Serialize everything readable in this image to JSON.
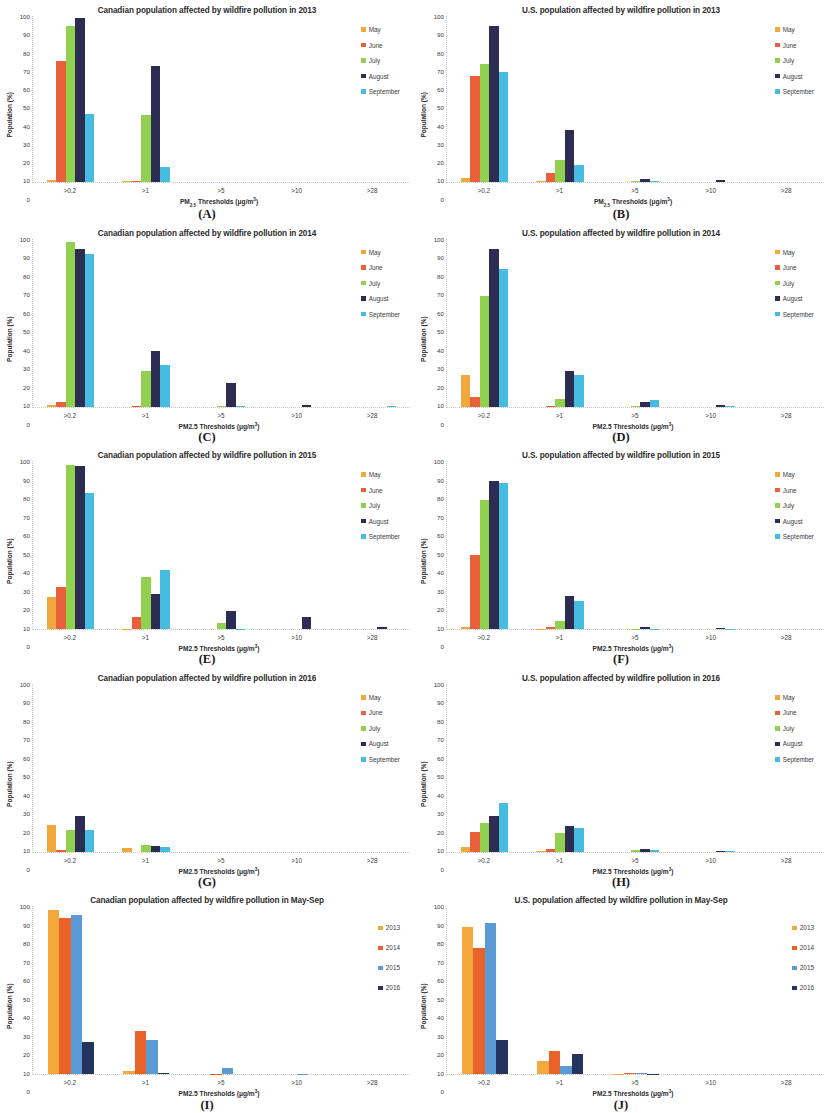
{
  "figure": {
    "axis": {
      "ylabel": "Population (%)",
      "yticks": [
        "100",
        "90",
        "80",
        "70",
        "60",
        "50",
        "40",
        "30",
        "20",
        "10",
        "0"
      ],
      "ylim": [
        0,
        100
      ],
      "xticks": [
        ">0.2",
        ">1",
        ">5",
        ">10",
        ">28"
      ],
      "xlabel_sub": "PM2.5 Thresholds (μg/m³)",
      "xlabel_plain": "PM2.5 Thresholds (μg/m³)"
    },
    "colors": {
      "may": "#F2A93B",
      "june": "#E8603C",
      "july": "#92D050",
      "august": "#2D2D54",
      "september": "#45BCE0",
      "y2013": "#F5A93C",
      "y2014": "#E8622A",
      "y2015": "#5B9BD5",
      "y2016": "#25345C"
    },
    "panels": [
      {
        "letter": "(A)",
        "title": "Canadian population affected by wildfire pollution in 2013",
        "xlabel_style": "sub",
        "legend": [
          "May",
          "June",
          "July",
          "August",
          "September"
        ],
        "legend_colors": [
          "#F2A93B",
          "#E8603C",
          "#92D050",
          "#2D2D54",
          "#45BCE0"
        ],
        "chart_data": {
          "type": "bar",
          "title": "Canadian population affected by wildfire pollution in 2013",
          "xlabel": "PM2.5 Thresholds (μg/m³)",
          "ylabel": "Population (%)",
          "ylim": [
            0,
            100
          ],
          "categories": [
            ">0.2",
            ">1",
            ">5",
            ">10",
            ">28"
          ],
          "series": [
            {
              "name": "May",
              "values": [
                1.0,
                0.5,
                0,
                0,
                0
              ]
            },
            {
              "name": "June",
              "values": [
                73,
                0.3,
                0,
                0,
                0
              ]
            },
            {
              "name": "July",
              "values": [
                94,
                40,
                0,
                0,
                0
              ]
            },
            {
              "name": "August",
              "values": [
                99,
                70,
                0,
                0,
                0
              ]
            },
            {
              "name": "September",
              "values": [
                41,
                9,
                0,
                0,
                0
              ]
            }
          ]
        }
      },
      {
        "letter": "(B)",
        "title": "U.S. population affected by wildfire pollution in 2013",
        "xlabel_style": "sub",
        "legend": [
          "May",
          "June",
          "July",
          "August",
          "September"
        ],
        "legend_colors": [
          "#F2A93B",
          "#E8603C",
          "#92D050",
          "#2D2D54",
          "#45BCE0"
        ],
        "chart_data": {
          "type": "bar",
          "title": "U.S. population affected by wildfire pollution in 2013",
          "xlabel": "PM2.5 Thresholds (μg/m³)",
          "ylabel": "Population (%)",
          "ylim": [
            0,
            100
          ],
          "categories": [
            ">0.2",
            ">1",
            ">5",
            ">10",
            ">28"
          ],
          "series": [
            {
              "name": "May",
              "values": [
                2,
                0.2,
                0,
                0,
                0
              ]
            },
            {
              "name": "June",
              "values": [
                64,
                5,
                0,
                0,
                0
              ]
            },
            {
              "name": "July",
              "values": [
                71,
                13,
                0.3,
                0,
                0
              ]
            },
            {
              "name": "August",
              "values": [
                94,
                31,
                1.5,
                0.7,
                0
              ]
            },
            {
              "name": "September",
              "values": [
                66,
                10,
                0.3,
                0,
                0
              ]
            }
          ]
        }
      },
      {
        "letter": "(C)",
        "title": "Canadian population affected by wildfire pollution in 2014",
        "xlabel_style": "plain",
        "legend": [
          "May",
          "June",
          "July",
          "August",
          "September"
        ],
        "legend_colors": [
          "#F2A93B",
          "#E8603C",
          "#92D050",
          "#2D2D54",
          "#45BCE0"
        ],
        "chart_data": {
          "type": "bar",
          "title": "Canadian population affected by wildfire pollution in 2014",
          "xlabel": "PM2.5 Thresholds (μg/m³)",
          "ylabel": "Population (%)",
          "ylim": [
            0,
            100
          ],
          "categories": [
            ">0.2",
            ">1",
            ">5",
            ">10",
            ">28"
          ],
          "series": [
            {
              "name": "May",
              "values": [
                1.2,
                0,
                0,
                0,
                0
              ]
            },
            {
              "name": "June",
              "values": [
                2.5,
                0.3,
                0,
                0,
                0
              ]
            },
            {
              "name": "July",
              "values": [
                98,
                21,
                0.5,
                0,
                0
              ]
            },
            {
              "name": "August",
              "values": [
                94,
                33,
                14,
                1.2,
                0
              ]
            },
            {
              "name": "September",
              "values": [
                91,
                25,
                0.2,
                0,
                0.3
              ]
            }
          ]
        }
      },
      {
        "letter": "(D)",
        "title": "U.S. population affected by wildfire pollution in 2014",
        "xlabel_style": "plain",
        "legend": [
          "May",
          "June",
          "July",
          "August",
          "September"
        ],
        "legend_colors": [
          "#F2A93B",
          "#E8603C",
          "#92D050",
          "#2D2D54",
          "#45BCE0"
        ],
        "chart_data": {
          "type": "bar",
          "title": "U.S. population affected by wildfire pollution in 2014",
          "xlabel": "PM2.5 Thresholds (μg/m³)",
          "ylabel": "Population (%)",
          "ylim": [
            0,
            100
          ],
          "categories": [
            ">0.2",
            ">1",
            ">5",
            ">10",
            ">28"
          ],
          "series": [
            {
              "name": "May",
              "values": [
                19,
                0,
                0,
                0,
                0
              ]
            },
            {
              "name": "June",
              "values": [
                5.5,
                0.2,
                0,
                0,
                0
              ]
            },
            {
              "name": "July",
              "values": [
                66,
                4.5,
                0.3,
                0,
                0
              ]
            },
            {
              "name": "August",
              "values": [
                94,
                21,
                2.5,
                0.8,
                0
              ]
            },
            {
              "name": "September",
              "values": [
                82,
                19,
                4,
                0.5,
                0
              ]
            }
          ]
        }
      },
      {
        "letter": "(E)",
        "title": "Canadian population affected by wildfire pollution in 2015",
        "xlabel_style": "plain",
        "legend": [
          "May",
          "June",
          "July",
          "August",
          "September"
        ],
        "legend_colors": [
          "#F2A93B",
          "#E8603C",
          "#92D050",
          "#2D2D54",
          "#45BCE0"
        ],
        "chart_data": {
          "type": "bar",
          "title": "Canadian population affected by wildfire pollution in 2015",
          "xlabel": "PM2.5 Thresholds (μg/m³)",
          "ylabel": "Population (%)",
          "ylim": [
            0,
            100
          ],
          "categories": [
            ">0.2",
            ">1",
            ">5",
            ">10",
            ">28"
          ],
          "series": [
            {
              "name": "May",
              "values": [
                19,
                0.3,
                0,
                0,
                0
              ]
            },
            {
              "name": "June",
              "values": [
                25,
                7,
                0,
                0,
                0
              ]
            },
            {
              "name": "July",
              "values": [
                98,
                31,
                3.5,
                0,
                0
              ]
            },
            {
              "name": "August",
              "values": [
                97,
                21,
                10.5,
                7,
                1.2
              ]
            },
            {
              "name": "September",
              "values": [
                81,
                35,
                0.3,
                0,
                0
              ]
            }
          ]
        }
      },
      {
        "letter": "(F)",
        "title": "U.S. population affected by wildfire pollution in 2015",
        "xlabel_style": "plain",
        "legend": [
          "May",
          "June",
          "July",
          "August",
          "September"
        ],
        "legend_colors": [
          "#F2A93B",
          "#E8603C",
          "#92D050",
          "#2D2D54",
          "#45BCE0"
        ],
        "chart_data": {
          "type": "bar",
          "title": "U.S. population affected by wildfire pollution in 2015",
          "xlabel": "PM2.5 Thresholds (μg/m³)",
          "ylabel": "Population (%)",
          "ylim": [
            0,
            100
          ],
          "categories": [
            ">0.2",
            ">1",
            ">5",
            ">10",
            ">28"
          ],
          "series": [
            {
              "name": "May",
              "values": [
                1.5,
                0.2,
                0,
                0,
                0
              ]
            },
            {
              "name": "June",
              "values": [
                44,
                1.5,
                0,
                0,
                0
              ]
            },
            {
              "name": "July",
              "values": [
                77,
                5,
                0.3,
                0,
                0
              ]
            },
            {
              "name": "August",
              "values": [
                88,
                20,
                1.5,
                0.6,
                0
              ]
            },
            {
              "name": "September",
              "values": [
                87,
                16.5,
                0.3,
                0.3,
                0
              ]
            }
          ]
        }
      },
      {
        "letter": "(G)",
        "title": "Canadian population affected by wildfire pollution in 2016",
        "xlabel_style": "plain",
        "legend": [
          "May",
          "June",
          "July",
          "August",
          "September"
        ],
        "legend_colors": [
          "#F2A93B",
          "#E8603C",
          "#92D050",
          "#2D2D54",
          "#45BCE0"
        ],
        "chart_data": {
          "type": "bar",
          "title": "Canadian population affected by wildfire pollution in 2016",
          "xlabel": "PM2.5 Thresholds (μg/m³)",
          "ylabel": "Population (%)",
          "ylim": [
            0,
            100
          ],
          "categories": [
            ">0.2",
            ">1",
            ">5",
            ">10",
            ">28"
          ],
          "series": [
            {
              "name": "May",
              "values": [
                16,
                2.5,
                0,
                0,
                0
              ]
            },
            {
              "name": "June",
              "values": [
                1.0,
                0,
                0,
                0,
                0
              ]
            },
            {
              "name": "July",
              "values": [
                13,
                4,
                0,
                0,
                0
              ]
            },
            {
              "name": "August",
              "values": [
                21,
                3.5,
                0,
                0,
                0
              ]
            },
            {
              "name": "September",
              "values": [
                13,
                3,
                0,
                0,
                0
              ]
            }
          ]
        }
      },
      {
        "letter": "(H)",
        "title": "U.S. population affected by wildfire pollution in 2016",
        "xlabel_style": "plain",
        "legend": [
          "May",
          "June",
          "July",
          "August",
          "September"
        ],
        "legend_colors": [
          "#F2A93B",
          "#E8603C",
          "#92D050",
          "#2D2D54",
          "#45BCE0"
        ],
        "chart_data": {
          "type": "bar",
          "title": "U.S. population affected by wildfire pollution in 2016",
          "xlabel": "PM2.5 Thresholds (μg/m³)",
          "ylabel": "Population (%)",
          "ylim": [
            0,
            100
          ],
          "categories": [
            ">0.2",
            ">1",
            ">5",
            ">10",
            ">28"
          ],
          "series": [
            {
              "name": "May",
              "values": [
                3,
                0.2,
                0,
                0,
                0
              ]
            },
            {
              "name": "June",
              "values": [
                12,
                1.5,
                0,
                0,
                0
              ]
            },
            {
              "name": "July",
              "values": [
                17,
                11,
                0.8,
                0,
                0
              ]
            },
            {
              "name": "August",
              "values": [
                21,
                15.5,
                1.8,
                0.3,
                0
              ]
            },
            {
              "name": "September",
              "values": [
                29,
                14,
                0.8,
                0.3,
                0
              ]
            }
          ]
        }
      },
      {
        "letter": "(I)",
        "title": "Canadian population affected by wildfire pollution in May-Sep",
        "xlabel_style": "plain",
        "legend": [
          "2013",
          "2014",
          "2015",
          "2016"
        ],
        "legend_colors": [
          "#F5A93C",
          "#E8622A",
          "#5B9BD5",
          "#25345C"
        ],
        "chart_data": {
          "type": "bar",
          "title": "Canadian population affected by wildfire pollution in May-Sep",
          "xlabel": "PM2.5 Thresholds (μg/m³)",
          "ylabel": "Population (%)",
          "ylim": [
            0,
            100
          ],
          "categories": [
            ">0.2",
            ">1",
            ">5",
            ">10",
            ">28"
          ],
          "series": [
            {
              "name": "2013",
              "values": [
                98,
                2,
                0,
                0,
                0
              ]
            },
            {
              "name": "2014",
              "values": [
                93,
                26,
                0.3,
                0,
                0
              ]
            },
            {
              "name": "2015",
              "values": [
                95,
                20.5,
                3.5,
                0.4,
                0
              ]
            },
            {
              "name": "2016",
              "values": [
                19,
                0.5,
                0,
                0,
                0
              ]
            }
          ]
        }
      },
      {
        "letter": "(J)",
        "title": "U.S. population affected by wildfire pollution in May-Sep",
        "xlabel_style": "plain",
        "legend": [
          "2013",
          "2014",
          "2015",
          "2016"
        ],
        "legend_colors": [
          "#F5A93C",
          "#E8622A",
          "#5B9BD5",
          "#25345C"
        ],
        "chart_data": {
          "type": "bar",
          "title": "U.S. population affected by wildfire pollution in May-Sep",
          "xlabel": "PM2.5 Thresholds (μg/m³)",
          "ylabel": "Population (%)",
          "ylim": [
            0,
            100
          ],
          "categories": [
            ">0.2",
            ">1",
            ">5",
            ">10",
            ">28"
          ],
          "series": [
            {
              "name": "2013",
              "values": [
                88,
                8,
                0.2,
                0,
                0
              ]
            },
            {
              "name": "2014",
              "values": [
                75.5,
                14,
                0.5,
                0,
                0
              ]
            },
            {
              "name": "2015",
              "values": [
                90,
                5,
                0.5,
                0,
                0
              ]
            },
            {
              "name": "2016",
              "values": [
                20.5,
                12,
                0.3,
                0,
                0
              ]
            }
          ]
        }
      }
    ]
  }
}
